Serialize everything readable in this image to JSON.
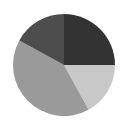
{
  "chart_data": {
    "type": "pie",
    "title": "",
    "categories": [
      "Slice A",
      "Slice B",
      "Slice C",
      "Slice D"
    ],
    "values": [
      25,
      17,
      41,
      17
    ],
    "colors": [
      "#333333",
      "#c8c8c8",
      "#9a9a9a",
      "#4d4d4d"
    ],
    "start_angle_deg": 0,
    "direction": "clockwise",
    "legend": null,
    "labels_shown": false
  },
  "layout": {
    "center": [
      64,
      65
    ],
    "radius": 51,
    "background": "#ffffff"
  }
}
